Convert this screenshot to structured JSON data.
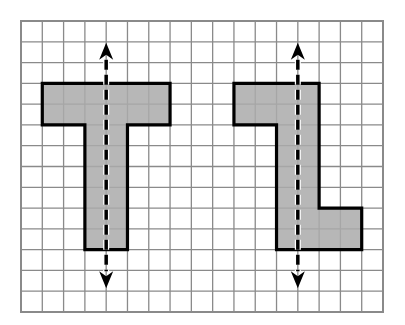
{
  "diagram": {
    "grid": {
      "columns": 17,
      "rows": 14,
      "line_color": "#8a8a8a",
      "background": "#ffffff"
    },
    "shape_style": {
      "fill": "#aaaaaa",
      "stroke": "#000000"
    },
    "axis_style": {
      "color": "#000000"
    },
    "shapes": [
      {
        "name": "letter-t-shape",
        "letter": "T",
        "cells_polygon": [
          [
            1,
            3
          ],
          [
            7,
            3
          ],
          [
            7,
            5
          ],
          [
            5,
            5
          ],
          [
            5,
            11
          ],
          [
            3,
            11
          ],
          [
            3,
            5
          ],
          [
            1,
            5
          ]
        ],
        "axis": {
          "col": 4,
          "from_row": 1,
          "to_row": 13
        },
        "symmetric": true
      },
      {
        "name": "letter-l-shape",
        "letter": "rotated L",
        "cells_polygon": [
          [
            10,
            3
          ],
          [
            14,
            3
          ],
          [
            14,
            9
          ],
          [
            16,
            9
          ],
          [
            16,
            11
          ],
          [
            12,
            11
          ],
          [
            12,
            5
          ],
          [
            10,
            5
          ]
        ],
        "axis": {
          "col": 13,
          "from_row": 1,
          "to_row": 13
        },
        "symmetric": false
      }
    ]
  }
}
